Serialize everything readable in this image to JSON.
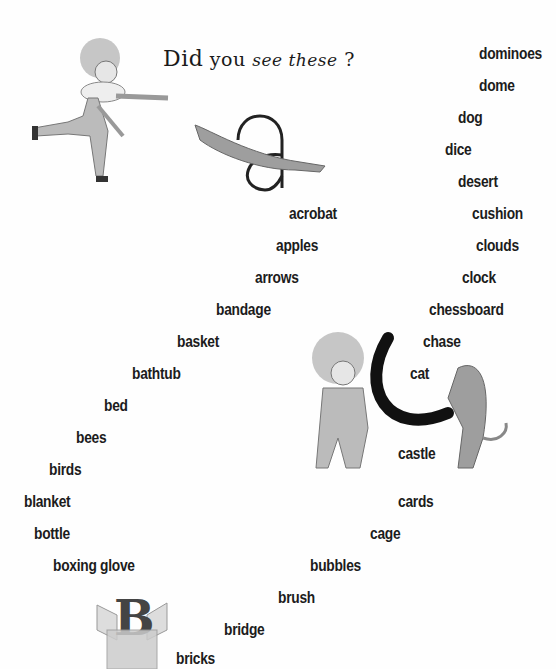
{
  "page": {
    "title_parts": [
      "Did",
      "you",
      "see these",
      "?"
    ],
    "background": "#fefefe",
    "text_color": "#1c1c1c"
  },
  "words": {
    "d": [
      "dominoes",
      "dome",
      "dog",
      "dice",
      "desert"
    ],
    "c": [
      "cushion",
      "clouds",
      "clock",
      "chessboard",
      "chase",
      "cat",
      "castle",
      "cards",
      "cage"
    ],
    "a": [
      "acrobat",
      "apples",
      "arrows"
    ],
    "b": [
      "bandage",
      "basket",
      "bathtub",
      "bed",
      "bees",
      "birds",
      "blanket",
      "bottle",
      "boxing glove",
      "bubbles",
      "brush",
      "bridge",
      "bricks"
    ]
  },
  "illustrations": {
    "top_left": "clown-running-icon",
    "top_letter": "a",
    "middle_letter": "c",
    "bottom_letter": "B"
  }
}
